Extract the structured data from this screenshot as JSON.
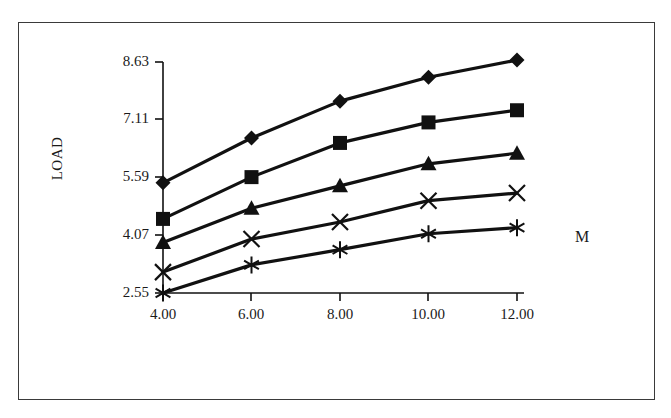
{
  "chart_data": {
    "type": "line",
    "title": "",
    "subtitle": "",
    "xlabel": "",
    "ylabel": "LOAD",
    "series_group_label": "M",
    "x": [
      4.0,
      6.0,
      8.0,
      10.0,
      12.0
    ],
    "categories": [
      "4.00",
      "6.00",
      "8.00",
      "10.00",
      "12.00"
    ],
    "xtick_labels": [
      "4.00",
      "6.00",
      "8.00",
      "10.00",
      "12.00"
    ],
    "ytick_labels": [
      "8.63",
      "7.11",
      "5.59",
      "4.07",
      "2.55"
    ],
    "ytick_values": [
      8.63,
      7.11,
      5.59,
      4.07,
      2.55
    ],
    "xlim": [
      4.0,
      12.0
    ],
    "ylim": [
      2.55,
      8.63
    ],
    "grid": false,
    "legend_position": "none",
    "series": [
      {
        "name": "series-1",
        "marker": "diamond",
        "color": "#111111",
        "values": [
          5.45,
          6.63,
          7.6,
          8.23,
          8.68
        ]
      },
      {
        "name": "series-2",
        "marker": "square",
        "color": "#111111",
        "values": [
          4.5,
          5.6,
          6.5,
          7.04,
          7.36
        ]
      },
      {
        "name": "series-3",
        "marker": "triangle",
        "color": "#111111",
        "values": [
          3.88,
          4.78,
          5.37,
          5.95,
          6.23
        ]
      },
      {
        "name": "series-4",
        "marker": "cross",
        "color": "#111111",
        "values": [
          3.1,
          3.97,
          4.42,
          4.98,
          5.18
        ]
      },
      {
        "name": "series-5",
        "marker": "asterisk",
        "color": "#111111",
        "values": [
          2.55,
          3.29,
          3.69,
          4.11,
          4.27
        ]
      }
    ]
  },
  "figure": {
    "border_color": "#3a3a3a",
    "axis_color": "#111111",
    "background": "#ffffff"
  }
}
